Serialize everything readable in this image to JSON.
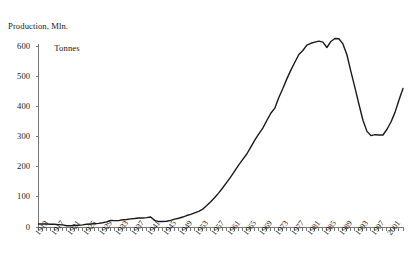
{
  "chart_data": {
    "type": "line",
    "title": "Production, Mln. Tonnes",
    "title_line_1": "Production, Mln.",
    "title_line_2": "Tonnes",
    "xlabel": "",
    "ylabel": "Production, Mln. Tonnes",
    "ylim": [
      0,
      600
    ],
    "xlim": [
      1913,
      2004
    ],
    "y_ticks": [
      0,
      100,
      200,
      300,
      400,
      500,
      600
    ],
    "y_tick_labels": [
      "0",
      "100",
      "200",
      "300",
      "400",
      "500",
      "600"
    ],
    "x_tick_labels": [
      "1913",
      "1917",
      "1921",
      "1925",
      "1929",
      "1933",
      "1937",
      "1941",
      "1945",
      "1949",
      "1953",
      "1957",
      "1961",
      "1965",
      "1969",
      "1973",
      "1977",
      "1981",
      "1985",
      "1989",
      "1993",
      "1997",
      "2001"
    ],
    "x_tick_step_years": 4,
    "x_minor_tick_step_years": 1,
    "grid": false,
    "legend": null,
    "line_color": "#1a1a1a",
    "line_width": 1.4,
    "axis_color": "#777777",
    "series": [
      {
        "name": "Production",
        "x": [
          1913,
          1914,
          1915,
          1916,
          1917,
          1918,
          1919,
          1920,
          1921,
          1922,
          1923,
          1924,
          1925,
          1926,
          1927,
          1928,
          1929,
          1930,
          1931,
          1932,
          1933,
          1934,
          1935,
          1936,
          1937,
          1938,
          1939,
          1940,
          1941,
          1942,
          1943,
          1944,
          1945,
          1946,
          1947,
          1948,
          1949,
          1950,
          1951,
          1952,
          1953,
          1954,
          1955,
          1956,
          1957,
          1958,
          1959,
          1960,
          1961,
          1962,
          1963,
          1964,
          1965,
          1966,
          1967,
          1968,
          1969,
          1970,
          1971,
          1972,
          1973,
          1974,
          1975,
          1976,
          1977,
          1978,
          1979,
          1980,
          1981,
          1982,
          1983,
          1984,
          1985,
          1986,
          1987,
          1988,
          1989,
          1990,
          1991,
          1992,
          1993,
          1994,
          1995,
          1996,
          1997,
          1998,
          1999,
          2000,
          2001,
          2002,
          2003,
          2004
        ],
        "values": [
          10,
          10,
          10,
          9,
          9,
          8,
          7,
          4,
          4,
          5,
          6,
          7,
          9,
          10,
          11,
          12,
          14,
          17,
          22,
          21,
          21,
          24,
          25,
          27,
          28,
          30,
          30,
          31,
          33,
          22,
          18,
          18,
          19,
          22,
          26,
          29,
          33,
          38,
          42,
          47,
          52,
          59,
          71,
          84,
          98,
          113,
          130,
          148,
          166,
          186,
          206,
          224,
          242,
          265,
          288,
          309,
          328,
          353,
          377,
          394,
          429,
          459,
          491,
          520,
          546,
          572,
          585,
          603,
          609,
          613,
          616,
          613,
          595,
          615,
          625,
          624,
          607,
          571,
          515,
          462,
          407,
          354,
          317,
          303,
          306,
          305,
          305,
          324,
          348,
          380,
          421,
          459
        ]
      }
    ]
  }
}
